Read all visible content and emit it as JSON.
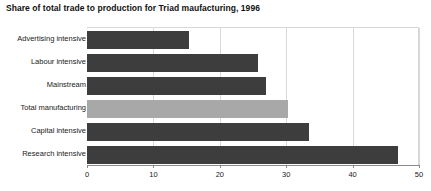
{
  "chart_data": {
    "type": "bar",
    "orientation": "horizontal",
    "title": "Share of total trade to production for Triad maufacturing, 1996",
    "xlabel": "",
    "ylabel": "",
    "xlim": [
      0,
      50
    ],
    "xticks": [
      "0",
      "10",
      "20",
      "30",
      "40",
      "50"
    ],
    "grid": true,
    "legend": "none",
    "categories": [
      "Advertising intensive",
      "Labour intensive",
      "Mainstream",
      "Total manufacturing",
      "Capital intensive",
      "Research intensive"
    ],
    "values": [
      15.3,
      25.8,
      26.9,
      30.3,
      33.4,
      46.8
    ],
    "bar_colors": [
      "#3d3d3d",
      "#3d3d3d",
      "#3d3d3d",
      "#a8a8a8",
      "#3d3d3d",
      "#3d3d3d"
    ],
    "colors": {
      "bar_default": "#3d3d3d",
      "bar_highlight": "#a8a8a8",
      "gridline": "#d9d9d9",
      "axis": "#8a8a8a",
      "text": "#1a1a1a",
      "background": "#ffffff"
    }
  }
}
